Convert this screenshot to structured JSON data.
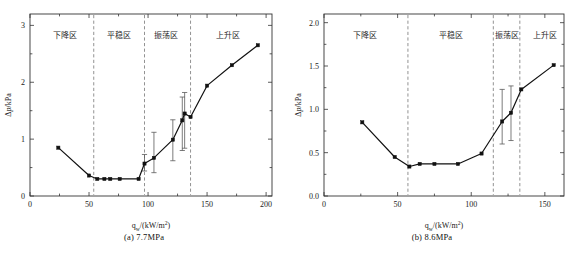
{
  "figure": {
    "title": "",
    "panels": [
      {
        "id": "panel-a",
        "caption": "(a) 7.7MPa",
        "xlabel": "q_w/(kW/m²)",
        "ylabel": "Δp/kPa",
        "pressure": "7.7MPa"
      },
      {
        "id": "panel-b",
        "caption": "(b) 8.6MPa",
        "xlabel": "q_w/(kW/m²)",
        "ylabel": "Δp/kPa",
        "pressure": "8.6MPa"
      }
    ]
  },
  "chart_data": [
    {
      "type": "line",
      "id": "panel-a",
      "title": "(a) 7.7MPa",
      "xlabel": "q_w/(kW/m²)",
      "ylabel": "Δp/kPa",
      "xlim": [
        0,
        205
      ],
      "ylim": [
        0,
        3.2
      ],
      "xticks": [
        0,
        50,
        100,
        150,
        200
      ],
      "xticklabels": [
        "0",
        "50",
        "100",
        "150",
        "200"
      ],
      "xminorticks": [
        25,
        75,
        125,
        175
      ],
      "yticks": [
        0,
        1,
        2,
        3
      ],
      "yticklabels": [
        "0",
        "1",
        "2",
        "3"
      ],
      "yminorticks": [
        0.5,
        1.5,
        2.5
      ],
      "grid": false,
      "legend": null,
      "marker": "square",
      "x": [
        24,
        50,
        57,
        63,
        68,
        76,
        92,
        97,
        105,
        121,
        129,
        131,
        136,
        150,
        171,
        193
      ],
      "y": [
        0.85,
        0.36,
        0.3,
        0.3,
        0.3,
        0.3,
        0.3,
        0.57,
        0.67,
        0.99,
        1.33,
        1.45,
        1.39,
        1.94,
        2.3,
        2.65
      ],
      "error_bars": [
        {
          "x": 97,
          "y": 0.57,
          "low": 0.44,
          "high": 0.73
        },
        {
          "x": 105,
          "y": 0.67,
          "low": 0.41,
          "high": 1.12
        },
        {
          "x": 121,
          "y": 0.99,
          "low": 0.62,
          "high": 1.34
        },
        {
          "x": 129,
          "y": 1.33,
          "low": 0.8,
          "high": 1.74
        },
        {
          "x": 131,
          "y": 1.45,
          "low": 0.84,
          "high": 1.82
        }
      ],
      "zone_boundaries": [
        54,
        97,
        136
      ],
      "zones": [
        {
          "label": "下降区",
          "x_center": 30,
          "range": [
            0,
            54
          ]
        },
        {
          "label": "平稳区",
          "x_center": 75,
          "range": [
            54,
            97
          ]
        },
        {
          "label": "振荡区",
          "x_center": 115,
          "range": [
            97,
            136
          ]
        },
        {
          "label": "上升区",
          "x_center": 168,
          "range": [
            136,
            205
          ]
        }
      ]
    },
    {
      "type": "line",
      "id": "panel-b",
      "title": "(b) 8.6MPa",
      "xlabel": "q_w/(kW/m²)",
      "ylabel": "Δp/kPa",
      "xlim": [
        0,
        163
      ],
      "ylim": [
        0,
        2.1
      ],
      "xticks": [
        0,
        50,
        100,
        150
      ],
      "xticklabels": [
        "0",
        "50",
        "100",
        "150"
      ],
      "xminorticks": [
        25,
        75,
        125
      ],
      "yticks": [
        0.0,
        0.5,
        1.0,
        1.5,
        2.0
      ],
      "yticklabels": [
        "0.0",
        "0.5",
        "1.0",
        "1.5",
        "2.0"
      ],
      "yminorticks": [
        0.25,
        0.75,
        1.25,
        1.75
      ],
      "grid": false,
      "legend": null,
      "marker": "square",
      "x": [
        26,
        48,
        58,
        65,
        75,
        91,
        107,
        121,
        127,
        134,
        156
      ],
      "y": [
        0.85,
        0.45,
        0.34,
        0.37,
        0.37,
        0.37,
        0.49,
        0.86,
        0.96,
        1.23,
        1.51
      ],
      "error_bars": [
        {
          "x": 121,
          "y": 0.86,
          "low": 0.6,
          "high": 1.23
        },
        {
          "x": 127,
          "y": 0.96,
          "low": 0.64,
          "high": 1.27
        }
      ],
      "zone_boundaries": [
        57,
        115,
        133
      ],
      "zones": [
        {
          "label": "下降区",
          "x_center": 28,
          "range": [
            0,
            57
          ]
        },
        {
          "label": "平稳区",
          "x_center": 86,
          "range": [
            57,
            115
          ]
        },
        {
          "label": "振荡区",
          "x_center": 124,
          "range": [
            115,
            133
          ]
        },
        {
          "label": "上升区",
          "x_center": 150,
          "range": [
            133,
            163
          ]
        }
      ]
    }
  ]
}
